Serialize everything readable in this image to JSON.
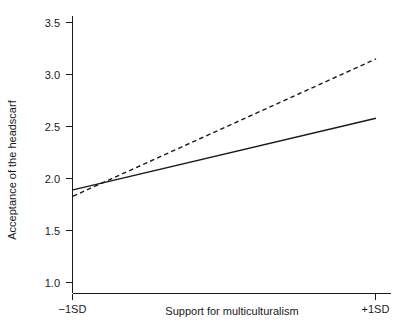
{
  "chart_data": {
    "type": "line",
    "title": "",
    "xlabel": "Support for multiculturalism",
    "ylabel": "Acceptance of the headscarf",
    "x": [
      "-1SD",
      "+1SD"
    ],
    "xtick_labels": [
      "−1SD",
      "+1SD"
    ],
    "ytick_labels": [
      "1.0",
      "1.5",
      "2.0",
      "2.5",
      "3.0",
      "3.5"
    ],
    "ytick_values": [
      1.0,
      1.5,
      2.0,
      2.5,
      3.0,
      3.5
    ],
    "ylim": [
      0.88,
      3.58
    ],
    "xlim": [
      -1.25,
      1.22
    ],
    "grid": false,
    "legend": "none",
    "series": [
      {
        "name": "solid-line",
        "style": "solid",
        "color": "#1a1a1a",
        "x": [
          "-1SD",
          "+1SD"
        ],
        "values": [
          1.89,
          2.58
        ]
      },
      {
        "name": "dashed-line",
        "style": "dashed",
        "color": "#1a1a1a",
        "x": [
          "-1SD",
          "+1SD"
        ],
        "values": [
          1.83,
          3.15
        ]
      }
    ]
  },
  "axes": {
    "y_title": "Acceptance of the headscarf",
    "x_title": "Support for multiculturalism",
    "y_ticks": [
      {
        "label": "3.5"
      },
      {
        "label": "3.0"
      },
      {
        "label": "2.5"
      },
      {
        "label": "2.0"
      },
      {
        "label": "1.5"
      },
      {
        "label": "1.0"
      }
    ],
    "x_ticks": [
      {
        "label": "−1SD"
      },
      {
        "label": "+1SD"
      }
    ]
  }
}
